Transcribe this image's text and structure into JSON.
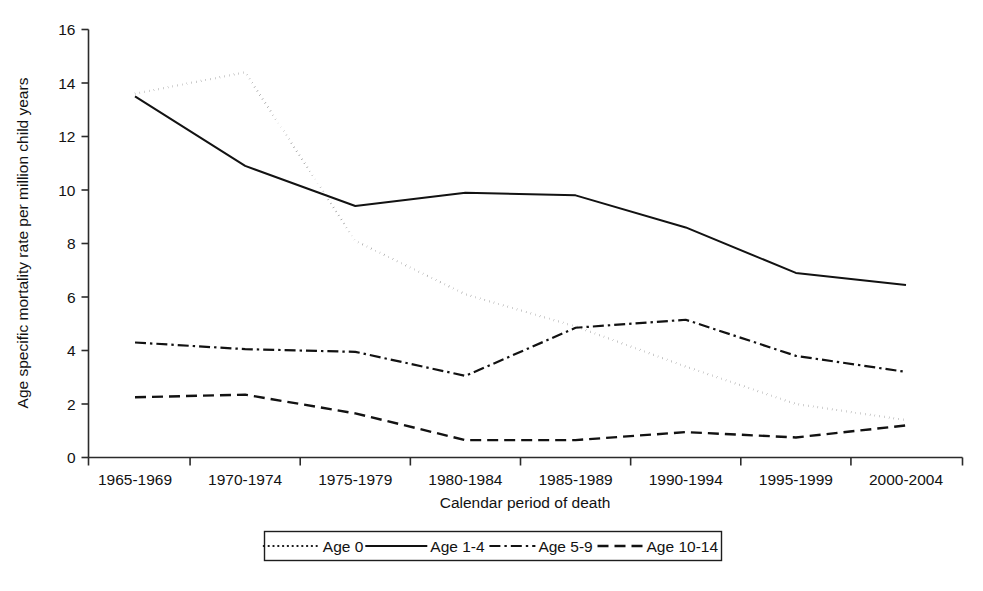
{
  "chart_data": {
    "type": "line",
    "title": "",
    "xlabel": "Calendar period of death",
    "ylabel": "Age specific mortality rate per million child years",
    "categories": [
      "1965-1969",
      "1970-1974",
      "1975-1979",
      "1980-1984",
      "1985-1989",
      "1990-1994",
      "1995-1999",
      "2000-2004"
    ],
    "ylim": [
      0,
      16
    ],
    "yticks": [
      0,
      2,
      4,
      6,
      8,
      10,
      12,
      14,
      16
    ],
    "ytick_labels": [
      "0",
      "2",
      "4",
      "6",
      "8",
      "10",
      "12",
      "14",
      "16"
    ],
    "grid": false,
    "legend_position": "bottom",
    "series": [
      {
        "name": "Age 0",
        "style": "dotted",
        "values": [
          13.6,
          14.4,
          8.1,
          6.1,
          4.9,
          3.4,
          2.0,
          1.4
        ]
      },
      {
        "name": "Age 1-4",
        "style": "solid",
        "values": [
          13.5,
          10.9,
          9.4,
          9.9,
          9.8,
          8.6,
          6.9,
          6.45
        ]
      },
      {
        "name": "Age 5-9",
        "style": "dash-dot",
        "values": [
          4.3,
          4.05,
          3.95,
          3.05,
          4.85,
          5.15,
          3.8,
          3.2
        ]
      },
      {
        "name": "Age 10-14",
        "style": "dashed",
        "values": [
          2.25,
          2.35,
          1.65,
          0.65,
          0.65,
          0.95,
          0.75,
          1.2
        ]
      }
    ]
  },
  "axes": {
    "y_title": "Age specific mortality rate per million child years",
    "x_title": "Calendar period of death"
  },
  "legend": {
    "entries": [
      {
        "label": "Age 0"
      },
      {
        "label": "Age 1-4"
      },
      {
        "label": "Age 5-9"
      },
      {
        "label": "Age 10-14"
      }
    ]
  }
}
